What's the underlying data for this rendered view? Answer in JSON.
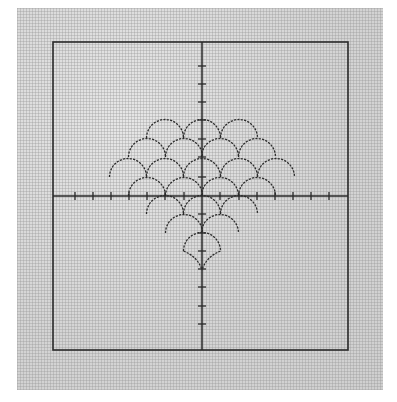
{
  "figure": {
    "colors": {
      "paper": "#dcdcdc",
      "ink": "#2a2a2a",
      "background": "#ffffff"
    },
    "frame": {
      "x": 53,
      "y": 42,
      "width": 295,
      "height": 308
    },
    "origin": {
      "x": 202,
      "y": 196
    },
    "tick_spacing": 18.3,
    "x_ticks": [
      75,
      93,
      111,
      129,
      147,
      165,
      184,
      220,
      239,
      257,
      275,
      293,
      311,
      329
    ],
    "y_ticks": [
      66,
      84,
      102,
      120,
      139,
      157,
      177,
      214,
      233,
      251,
      269,
      287,
      306,
      324
    ],
    "scale_radius": 18.5,
    "scale_rows": [
      {
        "cy": 138,
        "centers": [
          165,
          202,
          239
        ]
      },
      {
        "cy": 157,
        "centers": [
          147,
          184,
          220,
          257
        ]
      },
      {
        "cy": 177,
        "centers": [
          128,
          165,
          202,
          239,
          276
        ]
      },
      {
        "cy": 196,
        "centers": [
          147,
          184,
          220,
          257
        ]
      },
      {
        "cy": 214,
        "centers": [
          165,
          202,
          239
        ]
      },
      {
        "cy": 233,
        "centers": [
          184,
          220
        ]
      },
      {
        "cy": 251,
        "centers": [
          202
        ]
      }
    ]
  }
}
